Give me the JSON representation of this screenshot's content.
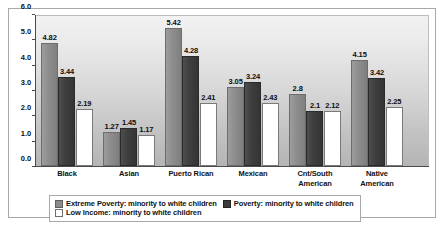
{
  "chart_data": {
    "type": "bar",
    "title": "",
    "xlabel": "",
    "ylabel": "",
    "ylim": [
      0,
      6
    ],
    "ytick_step": 1,
    "ytick_labels": [
      "0.0",
      "1.0",
      "2.0",
      "3.0",
      "4.0",
      "5.0",
      "6.0"
    ],
    "grid": false,
    "legend_position": "bottom",
    "categories": [
      "Black",
      "Asian",
      "Puerto Rican",
      "Mexican",
      "Cnt/South American",
      "Native American"
    ],
    "series": [
      {
        "name": "Extreme Poverty: minority to white children",
        "color": "#8b8b8b",
        "values": [
          4.82,
          1.27,
          5.42,
          3.05,
          2.8,
          4.15
        ],
        "labels": [
          "4.82",
          "1.27",
          "5.42",
          "3.05",
          "2.8",
          "4.15"
        ]
      },
      {
        "name": "Poverty: minority to white children",
        "color": "#3b3b3b",
        "values": [
          3.44,
          1.45,
          4.28,
          3.24,
          2.1,
          3.42
        ],
        "labels": [
          "3.44",
          "1.45",
          "4.28",
          "3.24",
          "2.1",
          "3.42"
        ]
      },
      {
        "name": "Low Income: minority to white children",
        "color": "#ffffff",
        "values": [
          2.19,
          1.17,
          2.41,
          2.43,
          2.12,
          2.25
        ],
        "labels": [
          "2.19",
          "1.17",
          "2.41",
          "2.43",
          "2.12",
          "2.25"
        ]
      }
    ]
  },
  "category_lines": [
    [
      "Black"
    ],
    [
      "Asian"
    ],
    [
      "Puerto Rican"
    ],
    [
      "Mexican"
    ],
    [
      "Cnt/South",
      "American"
    ],
    [
      "Native",
      "American"
    ]
  ]
}
